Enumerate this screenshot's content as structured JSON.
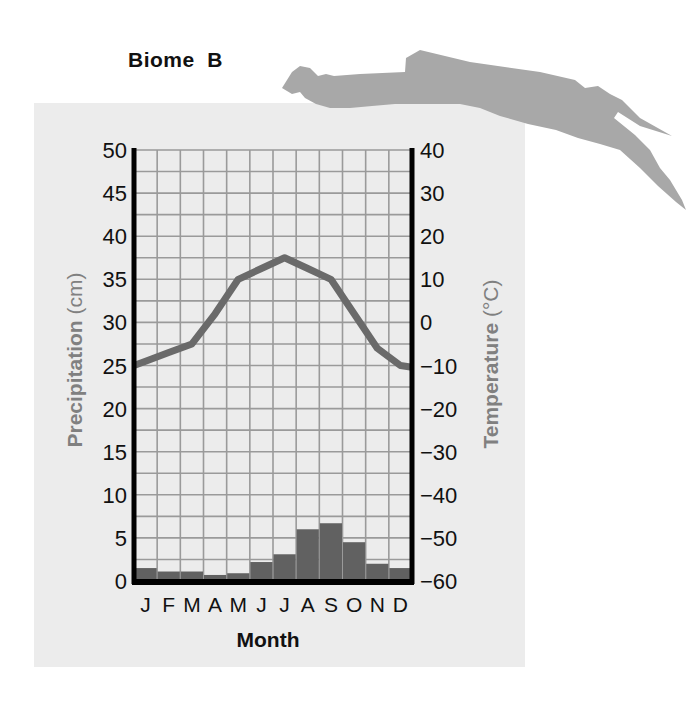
{
  "title": "Biome  B",
  "colors": {
    "panel": "#ececec",
    "grid": "#9a9a9a",
    "axis": "#000000",
    "bar": "#616161",
    "line": "#6a6a6a",
    "axis_label": "#808080",
    "map": "#a8a8a8"
  },
  "chart_data": {
    "type": "bar+line",
    "title": "Biome B",
    "xlabel": "Month",
    "categories": [
      "J",
      "F",
      "M",
      "A",
      "M",
      "J",
      "J",
      "A",
      "S",
      "O",
      "N",
      "D"
    ],
    "series": [
      {
        "name": "Precipitation",
        "type": "bar",
        "axis": "left",
        "unit": "cm",
        "values": [
          1.5,
          1.1,
          1.1,
          0.7,
          0.9,
          2.2,
          3.1,
          6.0,
          6.7,
          4.5,
          2.0,
          1.5
        ]
      },
      {
        "name": "Temperature",
        "type": "line",
        "axis": "right",
        "unit": "°C",
        "values": [
          -9,
          -7,
          -5,
          2,
          10,
          12.5,
          15,
          12.5,
          10,
          2,
          -6,
          -10
        ]
      }
    ],
    "y_left": {
      "label_bold": "Precipitation",
      "label_unit": " (cm)",
      "ylim": [
        0,
        50
      ],
      "ticks": [
        "0",
        "5",
        "10",
        "15",
        "20",
        "25",
        "30",
        "35",
        "40",
        "45",
        "50"
      ]
    },
    "y_right": {
      "label_bold": "Temperature",
      "label_unit": " (°C)",
      "ylim": [
        -60,
        40
      ],
      "ticks": [
        "−60",
        "−50",
        "−40",
        "−30",
        "−20",
        "−10",
        "0",
        "10",
        "20",
        "30",
        "40"
      ]
    },
    "grid": true,
    "grid_rows": 20,
    "legend": "none"
  }
}
